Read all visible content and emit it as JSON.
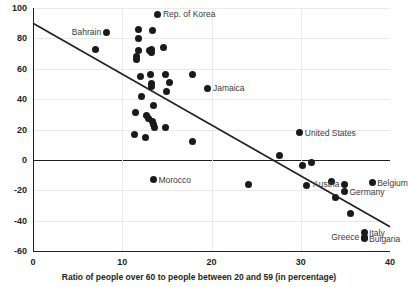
{
  "chart_data": {
    "type": "scatter",
    "title": "",
    "xlabel": "Ratio of people over 60 to people between 20 and 59 (in percentage)",
    "ylabel": "",
    "xlim": [
      0,
      40
    ],
    "ylim": [
      -60,
      100
    ],
    "xticks": [
      "0",
      "10",
      "20",
      "30",
      "40"
    ],
    "yticks": [
      "100",
      "80",
      "60",
      "40",
      "20",
      "0",
      "-20",
      "-40",
      "-60"
    ],
    "grid": true,
    "legend": "none",
    "zero_reference_line": 0,
    "trendline": {
      "type": "linear",
      "x_start": 0,
      "y_start": 90,
      "x_end": 40,
      "y_end": -44,
      "x_intercept": 26.9
    },
    "labeled_points": [
      {
        "label": "Rep. of Korea",
        "x": 14.0,
        "y": 96,
        "label_side": "right"
      },
      {
        "label": "Bahrain",
        "x": 8.2,
        "y": 84,
        "label_side": "left"
      },
      {
        "label": "Jamaica",
        "x": 19.6,
        "y": 47,
        "label_side": "right"
      },
      {
        "label": "United States",
        "x": 29.9,
        "y": 18,
        "label_side": "right"
      },
      {
        "label": "Morocco",
        "x": 13.5,
        "y": -13,
        "label_side": "right"
      },
      {
        "label": "Austria",
        "x": 34.9,
        "y": -16,
        "label_side": "left"
      },
      {
        "label": "Germany",
        "x": 34.9,
        "y": -21,
        "label_side": "right"
      },
      {
        "label": "Belgium",
        "x": 38.0,
        "y": -15,
        "label_side": "right"
      },
      {
        "label": "Greece",
        "x": 37.1,
        "y": -51,
        "label_side": "left"
      },
      {
        "label": "Italy",
        "x": 37.1,
        "y": -48,
        "label_side": "right"
      },
      {
        "label": "Bulgaria",
        "x": 37.1,
        "y": -52,
        "label_side": "right"
      }
    ],
    "unlabeled_points": [
      {
        "x": 7.0,
        "y": 73
      },
      {
        "x": 11.8,
        "y": 86
      },
      {
        "x": 13.4,
        "y": 85
      },
      {
        "x": 11.8,
        "y": 80
      },
      {
        "x": 11.8,
        "y": 72
      },
      {
        "x": 13.3,
        "y": 73
      },
      {
        "x": 13.3,
        "y": 71
      },
      {
        "x": 14.6,
        "y": 74
      },
      {
        "x": 11.6,
        "y": 68
      },
      {
        "x": 11.6,
        "y": 66
      },
      {
        "x": 13.1,
        "y": 72
      },
      {
        "x": 13.2,
        "y": 56
      },
      {
        "x": 12.0,
        "y": 55
      },
      {
        "x": 14.8,
        "y": 56
      },
      {
        "x": 13.3,
        "y": 50
      },
      {
        "x": 13.3,
        "y": 48
      },
      {
        "x": 15.3,
        "y": 51
      },
      {
        "x": 15.0,
        "y": 45
      },
      {
        "x": 17.9,
        "y": 56
      },
      {
        "x": 12.2,
        "y": 42
      },
      {
        "x": 13.5,
        "y": 36
      },
      {
        "x": 11.5,
        "y": 31
      },
      {
        "x": 12.7,
        "y": 29
      },
      {
        "x": 12.9,
        "y": 27
      },
      {
        "x": 13.4,
        "y": 25
      },
      {
        "x": 13.5,
        "y": 23
      },
      {
        "x": 13.6,
        "y": 21
      },
      {
        "x": 14.9,
        "y": 21
      },
      {
        "x": 11.4,
        "y": 17
      },
      {
        "x": 12.6,
        "y": 15
      },
      {
        "x": 17.9,
        "y": 12
      },
      {
        "x": 27.6,
        "y": 3
      },
      {
        "x": 30.2,
        "y": -4
      },
      {
        "x": 31.2,
        "y": -2
      },
      {
        "x": 24.1,
        "y": -16
      },
      {
        "x": 30.6,
        "y": -17
      },
      {
        "x": 33.4,
        "y": -14
      },
      {
        "x": 33.9,
        "y": -25
      },
      {
        "x": 35.6,
        "y": -35
      }
    ]
  }
}
